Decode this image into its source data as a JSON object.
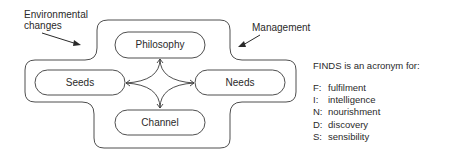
{
  "annotations": {
    "environmental": "Environmental\nchanges",
    "environmental_line1": "Environmental",
    "environmental_line2": "changes",
    "management": "Management"
  },
  "nodes": {
    "top": "Philosophy",
    "left": "Seeds",
    "right": "Needs",
    "bottom": "Channel"
  },
  "legend": {
    "title": "FINDS is an acronym for:",
    "items": [
      {
        "key": "F:",
        "value": "fulfilment"
      },
      {
        "key": "I:",
        "value": "intelligence"
      },
      {
        "key": "N:",
        "value": "nourishment"
      },
      {
        "key": "D:",
        "value": "discovery"
      },
      {
        "key": "S:",
        "value": "sensibility"
      }
    ]
  },
  "colors": {
    "stroke": "#3a3a3a",
    "text": "#2a2a2a",
    "background": "#ffffff"
  }
}
